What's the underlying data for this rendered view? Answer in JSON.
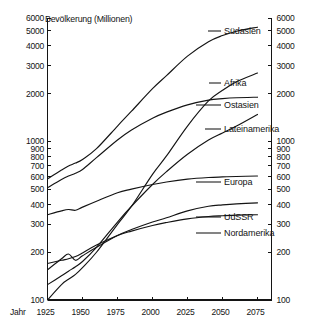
{
  "chart_data": {
    "type": "line",
    "title": "Bevölkerung (Millionen)",
    "xlabel": "Jahr",
    "ylabel": "",
    "yscale": "log",
    "ylim": [
      100,
      6000
    ],
    "xlim": [
      1925,
      2085
    ],
    "grid": false,
    "legend_position": "right-inline-labels",
    "x_ticks": [
      1925,
      1950,
      1975,
      2000,
      2025,
      2050,
      2075
    ],
    "y_ticks": [
      100,
      200,
      300,
      400,
      500,
      600,
      700,
      800,
      900,
      1000,
      2000,
      3000,
      4000,
      5000,
      6000
    ],
    "y_ticks_right": [
      100,
      200,
      300,
      400,
      500,
      600,
      700,
      800,
      900,
      1000,
      2000,
      3000,
      4000,
      5000,
      6000
    ],
    "x": [
      1925,
      1935,
      1940,
      1945,
      1950,
      1960,
      1975,
      1985,
      2000,
      2010,
      2025,
      2040,
      2050,
      2060,
      2075
    ],
    "series": [
      {
        "name": "Südasien",
        "values": [
          580,
          660,
          700,
          730,
          770,
          900,
          1250,
          1550,
          2150,
          2600,
          3450,
          4250,
          4650,
          4950,
          5250
        ]
      },
      {
        "name": "Afrika",
        "values": [
          100,
          125,
          135,
          145,
          160,
          200,
          300,
          390,
          620,
          810,
          1250,
          1800,
          2100,
          2380,
          2700
        ]
      },
      {
        "name": "Ostasien",
        "values": [
          510,
          575,
          605,
          630,
          665,
          790,
          1020,
          1180,
          1400,
          1530,
          1700,
          1820,
          1860,
          1885,
          1900
        ]
      },
      {
        "name": "Lateinamerika",
        "values": [
          125,
          142,
          152,
          162,
          175,
          215,
          310,
          390,
          535,
          645,
          830,
          1020,
          1130,
          1250,
          1480
        ]
      },
      {
        "name": "Europa",
        "values": [
          345,
          365,
          372,
          368,
          385,
          420,
          475,
          500,
          535,
          555,
          578,
          592,
          597,
          601,
          605
        ]
      },
      {
        "name": "UdSSR",
        "values": [
          155,
          182,
          195,
          178,
          190,
          215,
          255,
          278,
          310,
          330,
          365,
          390,
          398,
          404,
          410
        ]
      },
      {
        "name": "Nordamerika",
        "values": [
          170,
          178,
          182,
          188,
          198,
          222,
          255,
          272,
          295,
          308,
          325,
          336,
          340,
          343,
          345
        ]
      }
    ],
    "annotations": [
      "Afrika kreuzt Ostasien um 2040",
      "UdSSR Einbruch um 1940-1945"
    ]
  },
  "series_labels": [
    {
      "text": "Südasien"
    },
    {
      "text": "Afrika"
    },
    {
      "text": "Ostasien"
    },
    {
      "text": "Lateinamerika"
    },
    {
      "text": "Europa"
    },
    {
      "text": "UdSSR"
    },
    {
      "text": "Nordamerika"
    }
  ]
}
